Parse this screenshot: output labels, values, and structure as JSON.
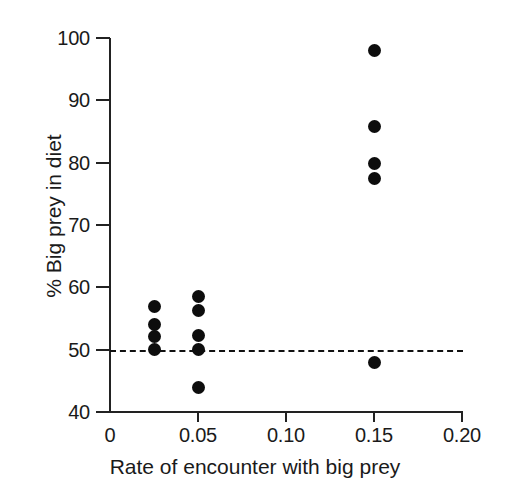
{
  "chart_data": {
    "type": "scatter",
    "title": "",
    "xlabel": "Rate of encounter with big prey",
    "ylabel": "% Big prey in diet",
    "xlim": [
      0,
      0.2
    ],
    "ylim": [
      40,
      100
    ],
    "xticks": [
      0,
      0.05,
      0.1,
      0.15,
      0.2
    ],
    "xticklabels": [
      "0",
      "0.05",
      "0.10",
      "0.15",
      "0.20"
    ],
    "yticks": [
      40,
      50,
      60,
      70,
      80,
      90,
      100
    ],
    "yticklabels": [
      "40",
      "50",
      "60",
      "70",
      "80",
      "90",
      "100"
    ],
    "grid": false,
    "legend": null,
    "marker": "filled-circle",
    "marker_color": "#0d0d0d",
    "reference_lines": [
      {
        "orientation": "horizontal",
        "value": 50,
        "style": "dashed",
        "color": "#111111"
      }
    ],
    "points": [
      {
        "x": 0.025,
        "y": 56.9
      },
      {
        "x": 0.025,
        "y": 54.1
      },
      {
        "x": 0.025,
        "y": 52.1
      },
      {
        "x": 0.025,
        "y": 50.0
      },
      {
        "x": 0.05,
        "y": 58.5
      },
      {
        "x": 0.05,
        "y": 56.3
      },
      {
        "x": 0.05,
        "y": 52.2
      },
      {
        "x": 0.05,
        "y": 50.0
      },
      {
        "x": 0.05,
        "y": 43.9
      },
      {
        "x": 0.15,
        "y": 98.0
      },
      {
        "x": 0.15,
        "y": 85.8
      },
      {
        "x": 0.15,
        "y": 79.8
      },
      {
        "x": 0.15,
        "y": 77.5
      },
      {
        "x": 0.15,
        "y": 48.0
      }
    ],
    "series": [
      {
        "name": "observations",
        "x": [
          0.025,
          0.025,
          0.025,
          0.025,
          0.05,
          0.05,
          0.05,
          0.05,
          0.05,
          0.15,
          0.15,
          0.15,
          0.15,
          0.15
        ],
        "y": [
          56.9,
          54.1,
          52.1,
          50.0,
          58.5,
          56.3,
          52.2,
          50.0,
          43.9,
          98.0,
          85.8,
          79.8,
          77.5,
          48.0
        ]
      }
    ]
  }
}
